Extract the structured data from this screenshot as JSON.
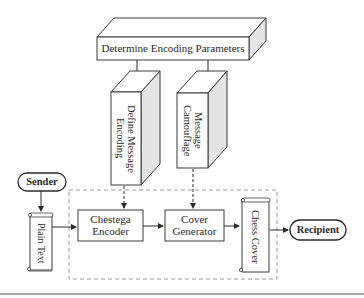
{
  "diagram": {
    "top_box": {
      "label": "Determine Encoding Parameters"
    },
    "define_box": {
      "label": "Define Message Encoding"
    },
    "camouflage_box": {
      "label": "Message Camouflage"
    },
    "sender": {
      "label": "Sender"
    },
    "plain_text": {
      "label": "Plain Text"
    },
    "encoder": {
      "label": "Chestega Encoder"
    },
    "generator": {
      "label": "Cover Generator"
    },
    "chess_cover": {
      "label": "Chess Cover"
    },
    "recipient": {
      "label": "Recipient"
    }
  },
  "colors": {
    "stroke": "#3a3a3a",
    "side_face": "#e4e4e4",
    "dashed": "#9a9a9a",
    "bottom_rule": "#8c8c8c"
  }
}
